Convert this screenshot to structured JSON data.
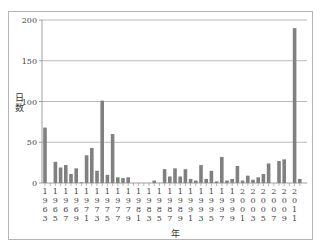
{
  "chart_data": {
    "type": "bar",
    "title": "",
    "xlabel": "年",
    "ylabel": "日数",
    "ylim": [
      0,
      200
    ],
    "yticks": [
      0,
      50,
      100,
      150,
      200
    ],
    "grid": "horizontal",
    "legend": "none",
    "bar_color": "#808080",
    "xtick_labels": [
      "1963",
      "1965",
      "1967",
      "1969",
      "1971",
      "1973",
      "1975",
      "1977",
      "1979",
      "1981",
      "1983",
      "1985",
      "1987",
      "1989",
      "1991",
      "1993",
      "1995",
      "1997",
      "1999",
      "2001",
      "2003",
      "2005",
      "2007",
      "2009",
      "2011"
    ],
    "categories": [
      "1963",
      "1964",
      "1965",
      "1966",
      "1967",
      "1968",
      "1969",
      "1970",
      "1971",
      "1972",
      "1973",
      "1974",
      "1975",
      "1976",
      "1977",
      "1978",
      "1979",
      "1980",
      "1981",
      "1982",
      "1983",
      "1984",
      "1985",
      "1986",
      "1987",
      "1988",
      "1989",
      "1990",
      "1991",
      "1992",
      "1993",
      "1994",
      "1995",
      "1996",
      "1997",
      "1998",
      "1999",
      "2000",
      "2001",
      "2002",
      "2003",
      "2004",
      "2005",
      "2006",
      "2007",
      "2008",
      "2009",
      "2010",
      "2011",
      "2012"
    ],
    "values": [
      68,
      0,
      26,
      19,
      22,
      11,
      18,
      1,
      34,
      43,
      15,
      101,
      10,
      60,
      7,
      6,
      7,
      0,
      0,
      0,
      0,
      3,
      0,
      17,
      8,
      18,
      8,
      17,
      5,
      3,
      22,
      5,
      15,
      2,
      32,
      3,
      5,
      21,
      3,
      9,
      4,
      7,
      11,
      24,
      0,
      27,
      29,
      0,
      190,
      5
    ]
  }
}
